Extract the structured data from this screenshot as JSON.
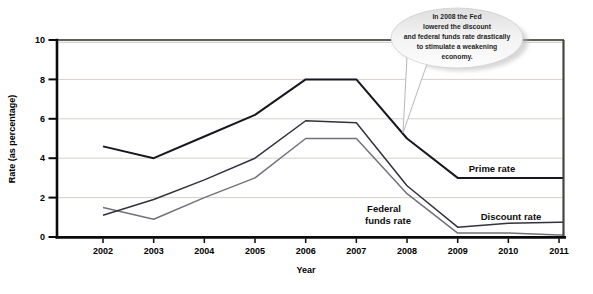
{
  "chart_data": {
    "type": "line",
    "title": "",
    "xlabel": "Year",
    "ylabel": "Rate (as percentage)",
    "x": [
      2002,
      2003,
      2004,
      2005,
      2006,
      2007,
      2008,
      2009,
      2010,
      2011
    ],
    "ylim": [
      0,
      10
    ],
    "yticks": [
      0,
      2,
      4,
      6,
      8,
      10
    ],
    "grid": true,
    "legend_position": "inline-labels",
    "series": [
      {
        "name": "Prime rate",
        "label_lines": [
          "Prime rate"
        ],
        "color": "#17171f",
        "width": 2,
        "values": [
          4.6,
          4.0,
          5.1,
          6.2,
          8.0,
          8.0,
          5.0,
          3.0,
          3.0,
          3.0
        ]
      },
      {
        "name": "Discount rate",
        "label_lines": [
          "Discount rate"
        ],
        "color": "#32323c",
        "width": 1.5,
        "values": [
          1.1,
          1.9,
          2.9,
          4.0,
          5.9,
          5.8,
          2.6,
          0.5,
          0.7,
          0.75
        ]
      },
      {
        "name": "Federal funds rate",
        "label_lines": [
          "Federal",
          "funds rate"
        ],
        "color": "#71717b",
        "width": 1.5,
        "values": [
          1.5,
          0.9,
          2.0,
          3.0,
          5.0,
          5.0,
          2.2,
          0.2,
          0.2,
          0.1
        ]
      }
    ],
    "annotation": {
      "text": "In 2008 the Fed lowered the discount and federal funds rate drastically to stimulate a weakening economy.",
      "lines": [
        "In 2008 the Fed",
        "lowered the discount",
        "and federal funds rate drastically",
        "to stimulate a weakening",
        "economy."
      ],
      "target_year": 2008
    }
  },
  "colors": {
    "grid": "#d6d1c9",
    "axis": "#0a0a0a",
    "frame_top": "#5f5f5a",
    "frame_top_shadow": "#cdc9c2",
    "frame_right": "#454540",
    "bubble_shadow": "#b5b5b5",
    "bubble_stroke": "#cfcfcf",
    "tail_stroke": "#b8b8b8"
  }
}
